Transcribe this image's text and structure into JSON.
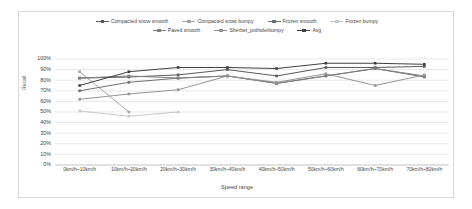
{
  "chart_data": {
    "type": "line",
    "title": "",
    "xlabel": "Speed range",
    "ylabel": "Recall",
    "ylim": [
      0,
      1
    ],
    "grid": true,
    "legend_position": "top",
    "categories": [
      "0km/h~10km/h",
      "10km/h~20km/h",
      "20km/h~30km/h",
      "30km/h~40km/h",
      "40km/h~50km/h",
      "50km/h~60km/h",
      "60km/h~70km/h",
      "70km/h~80km/h"
    ],
    "ytick_labels": [
      "100%",
      "90%",
      "80%",
      "70%",
      "60%",
      "50%",
      "40%",
      "30%",
      "20%",
      "10%",
      "0%"
    ],
    "ytick_values": [
      100,
      90,
      80,
      70,
      60,
      50,
      40,
      30,
      20,
      10,
      0
    ],
    "series": [
      {
        "name": "Compacted snow smooth",
        "color": "#595959",
        "values": [
          82,
          83,
          85,
          90,
          84,
          92,
          92,
          93
        ]
      },
      {
        "name": "Compacted snow bumpy",
        "color": "#a6a6a6",
        "values": [
          88,
          50,
          null,
          null,
          null,
          null,
          null,
          null
        ]
      },
      {
        "name": "Frozen smooth",
        "color": "#6e6e6e",
        "values": [
          70,
          78,
          82,
          84,
          77,
          84,
          91,
          83
        ]
      },
      {
        "name": "Frozen bumpy",
        "color": "#c8c8c8",
        "values": [
          51,
          46,
          50,
          null,
          null,
          null,
          null,
          null
        ]
      },
      {
        "name": "Paved smooth",
        "color": "#7f7f7f",
        "values": [
          82,
          84,
          82,
          84,
          77,
          84,
          91,
          84
        ]
      },
      {
        "name": "Sherbet_pothole/bumpy",
        "color": "#949494",
        "values": [
          62,
          67,
          71,
          84,
          78,
          86,
          75,
          85
        ]
      },
      {
        "name": "Avg",
        "color": "#404040",
        "values": [
          75,
          88,
          92,
          92,
          91,
          96,
          96,
          95
        ]
      }
    ]
  }
}
